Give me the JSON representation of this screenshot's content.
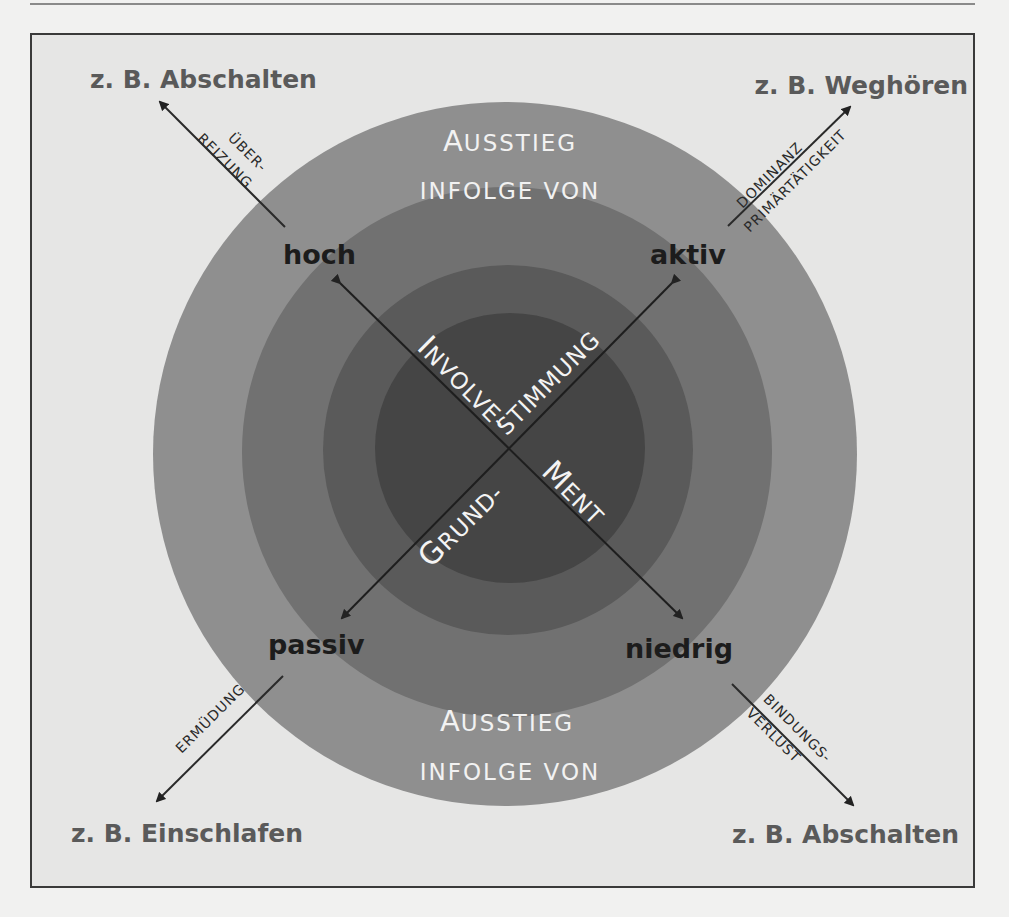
{
  "colors": {
    "background": "#e6e6e5",
    "ring_outer": "#8f8f8f",
    "ring_2": "#717171",
    "ring_3": "#5a5a5a",
    "ring_inner": "#454545",
    "arrow": "#222222"
  },
  "examples": {
    "top_left": "z. B. Abschalten",
    "top_right": "z. B. Weghören",
    "bottom_left": "z. B. Einschlafen",
    "bottom_right": "z. B. Abschalten"
  },
  "poles": {
    "top_left": "hoch",
    "top_right": "aktiv",
    "bottom_left": "passiv",
    "bottom_right": "niedrig"
  },
  "causes": {
    "top_left_line1": "ÜBER-",
    "top_left_line2": "REIZUNG",
    "top_right_line1": "DOMINANZ",
    "top_right_line2": "PRIMÄRTÄTIGKEIT",
    "bottom_left": "ERMÜDUNG",
    "bottom_right_line1": "BINDUNGS-",
    "bottom_right_line2": "VERLUST"
  },
  "exit_top": {
    "line1_initial": "A",
    "line1_rest": "USSTIEG",
    "line2": "INFOLGE VON"
  },
  "exit_bottom": {
    "line1_initial": "A",
    "line1_rest": "USSTIEG",
    "line2": "INFOLGE VON"
  },
  "axes": {
    "involvement_part1_initial": "I",
    "involvement_part1_rest": "NVOLVE-",
    "involvement_part2_initial": "M",
    "involvement_part2_rest": "ENT",
    "mood_part1_initial": "G",
    "mood_part1_rest": "RUND-",
    "mood_part2": "STIMMUNG"
  }
}
